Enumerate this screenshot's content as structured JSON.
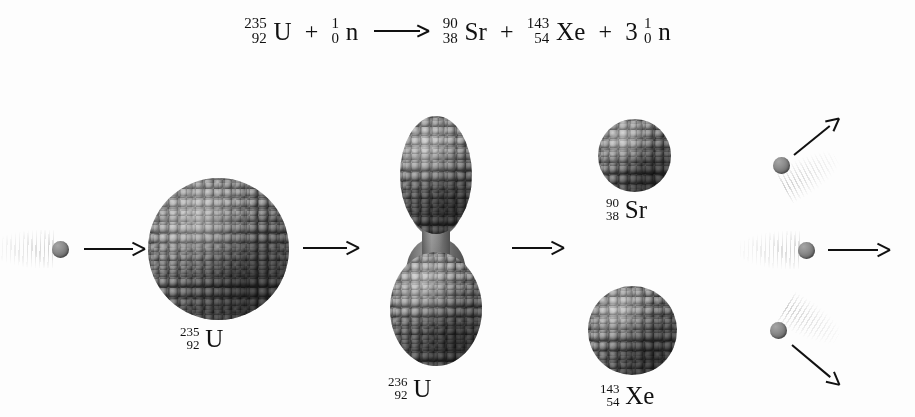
{
  "figure": {
    "title_equation": {
      "reactant_1": {
        "mass": "235",
        "atomic": "92",
        "symbol": "U"
      },
      "plus_1": "+",
      "reactant_2": {
        "mass": "1",
        "atomic": "0",
        "symbol": "n"
      },
      "yields": "⟶",
      "product_1": {
        "mass": "90",
        "atomic": "38",
        "symbol": "Sr"
      },
      "plus_2": "+",
      "product_2": {
        "mass": "143",
        "atomic": "54",
        "symbol": "Xe"
      },
      "plus_3": "+",
      "product_3": {
        "coefficient": "3",
        "mass": "1",
        "atomic": "0",
        "symbol": "n"
      }
    },
    "labels": {
      "u235": {
        "mass": "235",
        "atomic": "92",
        "symbol": "U"
      },
      "u236": {
        "mass": "236",
        "atomic": "92",
        "symbol": "U"
      },
      "sr90": {
        "mass": "90",
        "atomic": "38",
        "symbol": "Sr"
      },
      "xe143": {
        "mass": "143",
        "atomic": "54",
        "symbol": "Xe"
      }
    },
    "colors": {
      "background": "#fdfdfd",
      "ink": "#111111",
      "nucleon_light": "#8d8d8d",
      "nucleon_mid": "#7b7b7b",
      "nucleon_dark": "#4e4e4e",
      "neutron": "#8c8c8c"
    },
    "stages": [
      {
        "name": "incoming-neutron",
        "particle": "neutron",
        "motion": "right"
      },
      {
        "name": "target-nucleus",
        "particle": "uranium-235"
      },
      {
        "name": "compound-nucleus",
        "particle": "uranium-236",
        "shape": "elongated-dumbbell"
      },
      {
        "name": "fission-fragments",
        "particles": "strontium-90 and xenon-143"
      },
      {
        "name": "emitted-neutrons",
        "count": "3",
        "directions": "up-right, right, down-right"
      }
    ]
  }
}
